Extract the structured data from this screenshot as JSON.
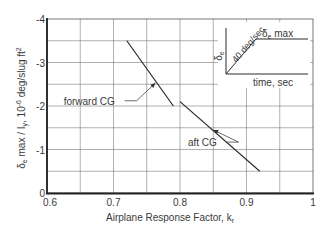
{
  "chart_data": {
    "type": "line",
    "title": "",
    "xlabel": "Airplane Response Factor, k",
    "xlabel_subscript": "r",
    "ylabel_parts": {
      "delta": "δ",
      "delta_sub": "e",
      "rest": " max / I",
      "i_sub": "y",
      "units_prefix": ",  10",
      "units_exp": "-6",
      "units_suffix": " deg/slug ft",
      "units_sq": "2"
    },
    "xlim": [
      0.6,
      1.0
    ],
    "ylim": [
      0,
      -4
    ],
    "x_ticks": [
      0.6,
      0.7,
      0.8,
      0.9,
      1.0
    ],
    "x_tick_labels": [
      "0.6",
      "0.7",
      "0.8",
      "0.9",
      "1"
    ],
    "y_ticks": [
      0,
      -1,
      -2,
      -3,
      -4
    ],
    "y_tick_labels": [
      "0",
      "-1",
      "-2",
      "-3",
      "-4"
    ],
    "grid": true,
    "grid_x_step": 0.05,
    "grid_y_step": 0.5,
    "legend": "none (inline labels)",
    "series": [
      {
        "name": "forward CG",
        "x": [
          0.72,
          0.79
        ],
        "y": [
          -3.5,
          -2.0
        ],
        "annotation": {
          "label": "forward CG",
          "label_x": 0.625,
          "label_y": -2.12,
          "arrow_to_x": 0.763,
          "arrow_to_y": -2.53
        }
      },
      {
        "name": "aft CG",
        "x": [
          0.8,
          0.92
        ],
        "y": [
          -2.1,
          -0.5
        ],
        "annotation": {
          "label": "aft CG",
          "label_x": 0.812,
          "label_y": -1.17,
          "arrow_to_x": 0.85,
          "arrow_to_y": -1.45
        }
      }
    ],
    "inset": {
      "description": "Elevator input time history",
      "y_axis_label_delta": "δ",
      "y_axis_label_sub": "e",
      "ramp_label": "40 deg/sec",
      "plateau_label_delta": "δ",
      "plateau_label_sub": "e",
      "plateau_label_rest": " max",
      "x_axis_label": "time, sec"
    }
  }
}
